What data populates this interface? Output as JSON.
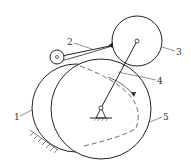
{
  "diagram": {
    "type": "cam mechanism schematic",
    "labels": {
      "l1": "1",
      "l2": "2",
      "l3": "3",
      "l4": "4",
      "l5": "5"
    },
    "colors": {
      "stroke": "#222222",
      "background": "#ffffff"
    }
  }
}
